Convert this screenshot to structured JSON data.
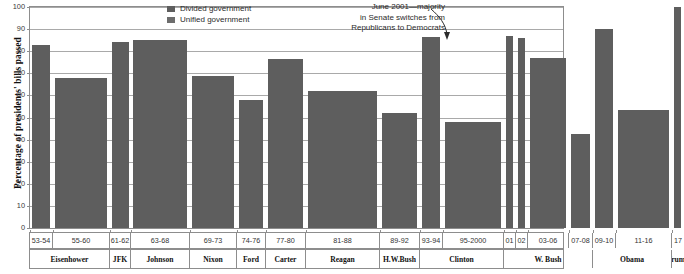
{
  "chart_data": {
    "type": "bar",
    "title": "",
    "xlabel": "",
    "ylabel": "Percentage of presidents' bills passed",
    "ylim": [
      0,
      100
    ],
    "yticks": [
      0,
      10,
      20,
      30,
      40,
      50,
      60,
      70,
      80,
      90,
      100
    ],
    "grid": true,
    "legend_position": "top-center",
    "bar_color": "#5e5e5e",
    "categories": [
      "53-54",
      "55-60",
      "61-62",
      "63-68",
      "69-73",
      "74-76",
      "77-80",
      "81-88",
      "89-92",
      "93-94",
      "95-2000",
      "01",
      "02",
      "03-06",
      "07-08",
      "09-10",
      "11-16",
      "17"
    ],
    "values": [
      83,
      68,
      84,
      85,
      69,
      58,
      76.5,
      62,
      52,
      86.5,
      48,
      87,
      86,
      77,
      42.5,
      90,
      53.5,
      100
    ],
    "series_of": [
      "Divided government",
      "Unified government",
      "Unified government",
      "Unified government",
      "Divided government",
      "Divided government",
      "Unified government",
      "Divided government",
      "Divided government",
      "Unified government",
      "Divided government",
      "Divided government",
      "Divided government",
      "Unified government",
      "Divided government",
      "Unified government",
      "Divided government",
      "Unified government"
    ],
    "presidents": [
      {
        "name": "Eisenhower",
        "periods": [
          "53-54",
          "55-60"
        ]
      },
      {
        "name": "JFK",
        "periods": [
          "61-62"
        ]
      },
      {
        "name": "Johnson",
        "periods": [
          "63-68"
        ]
      },
      {
        "name": "Nixon",
        "periods": [
          "69-73"
        ]
      },
      {
        "name": "Ford",
        "periods": [
          "74-76"
        ]
      },
      {
        "name": "Carter",
        "periods": [
          "77-80"
        ]
      },
      {
        "name": "Reagan",
        "periods": [
          "81-88"
        ]
      },
      {
        "name": "H.W.Bush",
        "periods": [
          "89-92"
        ]
      },
      {
        "name": "Clinton",
        "periods": [
          "93-94",
          "95-2000"
        ]
      },
      {
        "name": "W. Bush",
        "periods": [
          "01",
          "02",
          "03-06",
          "07-08"
        ]
      },
      {
        "name": "Obama",
        "periods": [
          "09-10",
          "11-16"
        ]
      },
      {
        "name": "Trump",
        "periods": [
          "17"
        ]
      }
    ],
    "annotations": [
      {
        "text": "June 2001—majority in Senate switches from Republicans to Democrats",
        "points_to": "02"
      }
    ]
  },
  "legend": {
    "items": [
      {
        "label": "Divided government",
        "color": "#5e5e5e"
      },
      {
        "label": "Unified government",
        "color": "#6d6d6d"
      }
    ]
  },
  "annotation": {
    "line1": "June 2001—majority",
    "line2": "in Senate switches from",
    "line3": "Republicans to Democrats"
  },
  "axis": {
    "ylabel": "Percentage of presidents' bills passed",
    "yticks": [
      "100",
      "90",
      "80",
      "70",
      "60",
      "50",
      "40",
      "30",
      "20",
      "10",
      "0"
    ]
  },
  "bars": [
    {
      "period": "53-54",
      "value": 83,
      "x": 2,
      "w": 18
    },
    {
      "period": "55-60",
      "value": 68,
      "x": 25,
      "w": 52
    },
    {
      "period": "61-62",
      "value": 84,
      "x": 82,
      "w": 17
    },
    {
      "period": "63-68",
      "value": 85,
      "x": 103,
      "w": 54
    },
    {
      "period": "69-73",
      "value": 69,
      "x": 162,
      "w": 42
    },
    {
      "period": "74-76",
      "value": 58,
      "x": 209,
      "w": 24
    },
    {
      "period": "77-80",
      "value": 76.5,
      "x": 238,
      "w": 35
    },
    {
      "period": "81-88",
      "value": 62,
      "x": 278,
      "w": 69
    },
    {
      "period": "89-92",
      "value": 52,
      "x": 352,
      "w": 35
    },
    {
      "period": "93-94",
      "value": 86.5,
      "x": 392,
      "w": 18
    },
    {
      "period": "95-2000",
      "value": 48,
      "x": 415,
      "w": 56
    },
    {
      "period": "01",
      "value": 87,
      "x": 476,
      "w": 7
    },
    {
      "period": "02",
      "value": 86,
      "x": 488,
      "w": 7
    },
    {
      "period": "03-06",
      "value": 77,
      "x": 500,
      "w": 36
    },
    {
      "period": "07-08",
      "value": 42.5,
      "x": 541,
      "w": 19
    },
    {
      "period": "09-10",
      "value": 90,
      "x": 565,
      "w": 18
    },
    {
      "period": "11-16",
      "value": 53.5,
      "x": 588,
      "w": 51
    },
    {
      "period": "17",
      "value": 100,
      "x": 644,
      "w": 7
    }
  ],
  "period_cells": [
    {
      "label": "53-54",
      "x": 0,
      "w": 23
    },
    {
      "label": "55-60",
      "x": 23,
      "w": 57
    },
    {
      "label": "61-62",
      "x": 80,
      "w": 21
    },
    {
      "label": "63-68",
      "x": 101,
      "w": 59
    },
    {
      "label": "69-73",
      "x": 160,
      "w": 47
    },
    {
      "label": "74-76",
      "x": 207,
      "w": 29
    },
    {
      "label": "77-80",
      "x": 236,
      "w": 40
    },
    {
      "label": "81-88",
      "x": 276,
      "w": 74
    },
    {
      "label": "89-92",
      "x": 350,
      "w": 40
    },
    {
      "label": "93-94",
      "x": 390,
      "w": 23
    },
    {
      "label": "95-2000",
      "x": 413,
      "w": 61
    },
    {
      "label": "01",
      "x": 474,
      "w": 12
    },
    {
      "label": "02",
      "x": 486,
      "w": 12
    },
    {
      "label": "03-06",
      "x": 498,
      "w": 41
    },
    {
      "label": "07-08",
      "x": 539,
      "w": 24
    },
    {
      "label": "09-10",
      "x": 563,
      "w": 23
    },
    {
      "label": "11-16",
      "x": 586,
      "w": 56
    },
    {
      "label": "17",
      "x": 642,
      "w": 12
    }
  ],
  "president_cells": [
    {
      "label": "Eisenhower",
      "x": 0,
      "w": 80
    },
    {
      "label": "JFK",
      "x": 80,
      "w": 21
    },
    {
      "label": "Johnson",
      "x": 101,
      "w": 59
    },
    {
      "label": "Nixon",
      "x": 160,
      "w": 47
    },
    {
      "label": "Ford",
      "x": 207,
      "w": 29
    },
    {
      "label": "Carter",
      "x": 236,
      "w": 40
    },
    {
      "label": "Reagan",
      "x": 276,
      "w": 74
    },
    {
      "label": "H.W.Bush",
      "x": 350,
      "w": 40
    },
    {
      "label": "Clinton",
      "x": 390,
      "w": 84
    },
    {
      "label": "W. Bush",
      "x": 474,
      "w": 89
    },
    {
      "label": "Obama",
      "x": 563,
      "w": 79
    },
    {
      "label": "Trump",
      "x": 642,
      "w": 12
    }
  ]
}
